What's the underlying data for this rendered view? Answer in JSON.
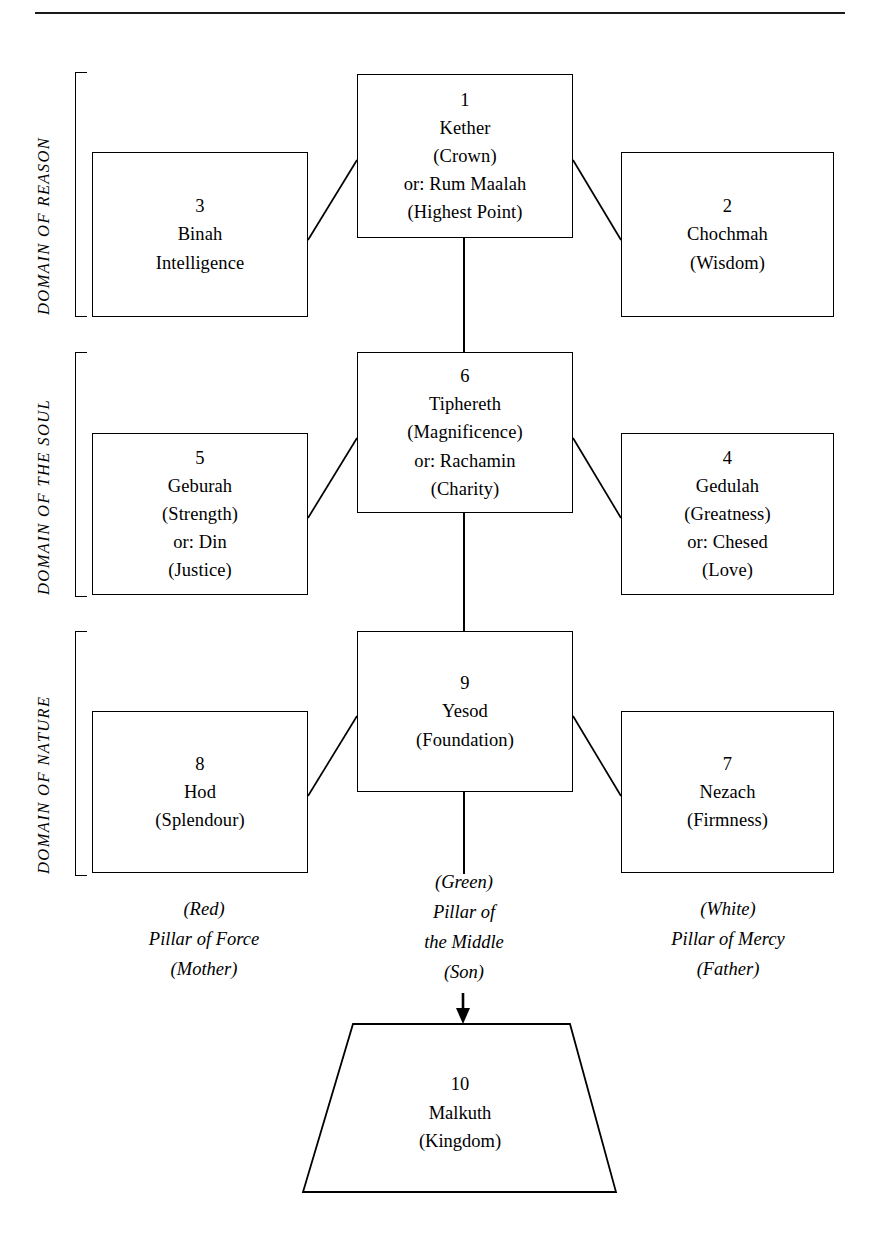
{
  "diagram": {
    "title_rule": true,
    "domains": [
      {
        "label": "DOMAIN OF REASON"
      },
      {
        "label": "DOMAIN OF THE SOUL"
      },
      {
        "label": "DOMAIN OF NATURE"
      }
    ],
    "nodes": [
      {
        "id": "kether",
        "number": "1",
        "name": "Kether",
        "lines": [
          "(Crown)",
          "or: Rum Maalah",
          "(Highest Point)"
        ]
      },
      {
        "id": "chochmah",
        "number": "2",
        "name": "Chochmah",
        "lines": [
          "(Wisdom)"
        ]
      },
      {
        "id": "binah",
        "number": "3",
        "name": "Binah",
        "lines": [
          "Intelligence"
        ]
      },
      {
        "id": "gedulah",
        "number": "4",
        "name": "Gedulah",
        "lines": [
          "(Greatness)",
          "or: Chesed",
          "(Love)"
        ]
      },
      {
        "id": "geburah",
        "number": "5",
        "name": "Geburah",
        "lines": [
          "(Strength)",
          "or:  Din",
          "(Justice)"
        ]
      },
      {
        "id": "tiphereth",
        "number": "6",
        "name": "Tiphereth",
        "lines": [
          "(Magnificence)",
          "or: Rachamin",
          "(Charity)"
        ]
      },
      {
        "id": "nezach",
        "number": "7",
        "name": "Nezach",
        "lines": [
          "(Firmness)"
        ]
      },
      {
        "id": "hod",
        "number": "8",
        "name": "Hod",
        "lines": [
          "(Splendour)"
        ]
      },
      {
        "id": "yesod",
        "number": "9",
        "name": "Yesod",
        "lines": [
          "(Foundation)"
        ]
      },
      {
        "id": "malkuth",
        "number": "10",
        "name": "Malkuth",
        "lines": [
          "(Kingdom)"
        ]
      }
    ],
    "pillars": [
      {
        "id": "left",
        "color": "(Red)",
        "name_line1": "Pillar of Force",
        "name_line2": "",
        "role": "(Mother)"
      },
      {
        "id": "middle",
        "color": "(Green)",
        "name_line1": "Pillar of",
        "name_line2": "the Middle",
        "role": "(Son)"
      },
      {
        "id": "right",
        "color": "(White)",
        "name_line1": "Pillar of Mercy",
        "name_line2": "",
        "role": "(Father)"
      }
    ],
    "colors": {
      "ink": "#000000",
      "paper": "#ffffff"
    }
  }
}
